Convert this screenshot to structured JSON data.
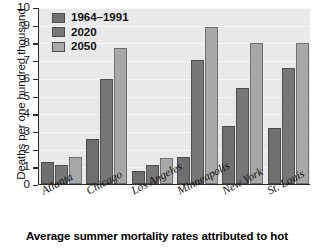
{
  "caption": "Average summer mortality rates attributed to hot",
  "axis": {
    "ylabel": "Deaths per one hundred thousand",
    "yticks": [
      "0",
      "1",
      "2",
      "3",
      "4",
      "5",
      "6",
      "7",
      "8",
      "9",
      "10"
    ]
  },
  "legend": [
    {
      "label": "1964–1991",
      "color": "#6f6f6f"
    },
    {
      "label": "2020",
      "color": "#777777"
    },
    {
      "label": "2050",
      "color": "#a8a8a8"
    }
  ],
  "chart_data": {
    "type": "bar",
    "title": "Average summer mortality rates attributed to hot",
    "xlabel": "",
    "ylabel": "Deaths per one hundred thousand",
    "ylim": [
      0,
      10
    ],
    "ytick_step": 1,
    "grid": true,
    "legend_position": "top-left",
    "categories": [
      "Atlanta",
      "Chicago",
      "Los Angeles",
      "Minneapolis",
      "New York",
      "St. Louis"
    ],
    "series": [
      {
        "name": "1964–1991",
        "color": "#6f6f6f",
        "values": [
          1.25,
          2.55,
          0.75,
          1.55,
          3.25,
          3.15
        ]
      },
      {
        "name": "2020",
        "color": "#777777",
        "values": [
          1.1,
          5.95,
          1.05,
          7.0,
          5.45,
          6.55
        ]
      },
      {
        "name": "2050",
        "color": "#a8a8a8",
        "values": [
          1.55,
          7.7,
          1.45,
          8.85,
          7.95,
          7.95
        ]
      }
    ]
  }
}
